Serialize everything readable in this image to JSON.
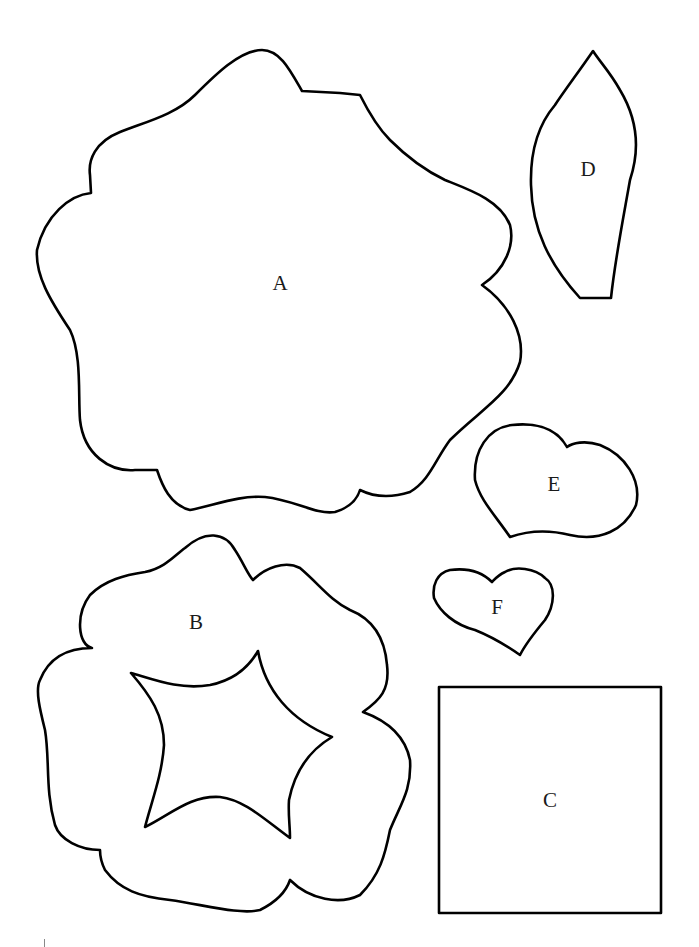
{
  "page": {
    "background": "#ffffff",
    "stroke_color": "#000000"
  },
  "pieces": [
    {
      "id": "A",
      "label": "A",
      "shape": "large-scalloped-flower"
    },
    {
      "id": "B",
      "label": "B",
      "shape": "scalloped-ring-with-star-cutout"
    },
    {
      "id": "C",
      "label": "C",
      "shape": "square"
    },
    {
      "id": "D",
      "label": "D",
      "shape": "leaf"
    },
    {
      "id": "E",
      "label": "E",
      "shape": "large-heart"
    },
    {
      "id": "F",
      "label": "F",
      "shape": "small-heart"
    }
  ]
}
